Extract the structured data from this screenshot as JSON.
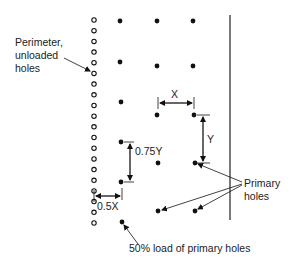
{
  "diagram": {
    "type": "blast-hole-pattern",
    "labels": {
      "perimeter_line1": "Perimeter,",
      "perimeter_line2": "unloaded",
      "perimeter_line3": "holes",
      "primary_line1": "Primary",
      "primary_line2": "holes",
      "fifty_percent": "50% load of primary holes"
    },
    "dimensions": {
      "x": "X",
      "y": "Y",
      "y75": "0.75Y",
      "x50": "0.5X"
    },
    "colors": {
      "ink": "#111111",
      "background": "#ffffff"
    },
    "perimeter_holes": {
      "x": 94,
      "y_start": 20,
      "y_end": 223,
      "count": 20,
      "style": "open-circle"
    },
    "half_load_holes": [
      {
        "x": 120,
        "y": 21
      },
      {
        "x": 120,
        "y": 62
      },
      {
        "x": 121,
        "y": 102
      },
      {
        "x": 121,
        "y": 142
      },
      {
        "x": 121,
        "y": 182
      },
      {
        "x": 122,
        "y": 222
      }
    ],
    "primary_holes": [
      {
        "x": 157,
        "y": 21
      },
      {
        "x": 193,
        "y": 21
      },
      {
        "x": 157,
        "y": 66
      },
      {
        "x": 193,
        "y": 66
      },
      {
        "x": 157,
        "y": 115
      },
      {
        "x": 194,
        "y": 115
      },
      {
        "x": 158,
        "y": 163
      },
      {
        "x": 195,
        "y": 163
      },
      {
        "x": 158,
        "y": 211
      },
      {
        "x": 195,
        "y": 211
      }
    ],
    "free_face_line": {
      "x": 230,
      "y1": 15,
      "y2": 220
    }
  }
}
